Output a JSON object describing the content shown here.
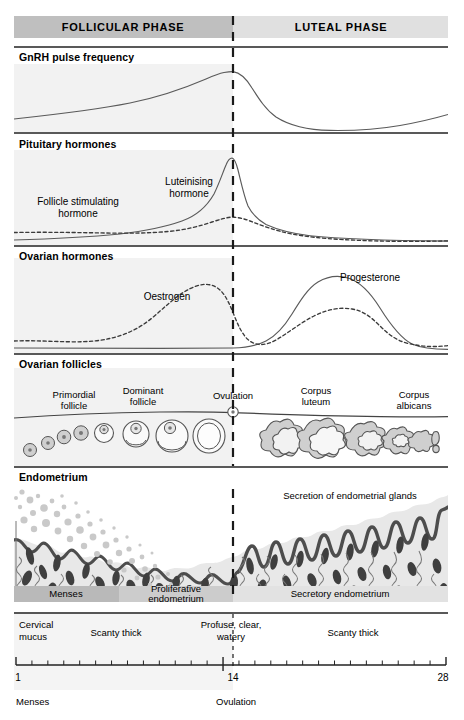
{
  "figure": {
    "width": 464,
    "height": 720
  },
  "colors": {
    "follicular_header_fill": "#bfbfbf",
    "luteal_header_fill": "#e0e0e0",
    "panel_tint": "#f2f2f2",
    "line": "#555555",
    "rule": "#333333",
    "follicle_fill": "#cfcfcf",
    "endometrium_fill": "#e8e8e8",
    "gland_fill": "#4a4a4a",
    "menses_band": "#b9b9b9",
    "proliferative_band": "#cccccc",
    "secretory_band": "#e2e2e2",
    "blood_dot": "#c8c8c8"
  },
  "header": {
    "follicular": "FOLLICULAR PHASE",
    "luteal": "LUTEAL PHASE"
  },
  "sections": [
    {
      "id": "gnrh",
      "label": "GnRH pulse frequency"
    },
    {
      "id": "pituitary",
      "label": "Pituitary hormones"
    },
    {
      "id": "ovarian",
      "label": "Ovarian hormones"
    },
    {
      "id": "follicles",
      "label": "Ovarian follicles"
    },
    {
      "id": "endometrium",
      "label": "Endometrium"
    }
  ],
  "curve_labels": {
    "fsh": "Follicle stimulating\nhormone",
    "fsh_line1": "Follicle stimulating",
    "fsh_line2": "hormone",
    "lh_line1": "Luteinising",
    "lh_line2": "hormone",
    "oestrogen": "Oestrogen",
    "progesterone": "Progesterone"
  },
  "follicle_stage_labels": [
    {
      "line1": "Primordial",
      "line2": "follicle"
    },
    {
      "line1": "Dominant",
      "line2": "follicle"
    },
    {
      "line1": "Ovulation",
      "line2": ""
    },
    {
      "line1": "Corpus",
      "line2": "luteum"
    },
    {
      "line1": "Corpus",
      "line2": "albicans"
    }
  ],
  "endometrium": {
    "secretion_note": "Secretion of endometrial glands",
    "bands": [
      {
        "label": "Menses",
        "label_line1": "Menses",
        "label_line2": ""
      },
      {
        "label": "Proliferative endometrium",
        "label_line1": "Proliferative",
        "label_line2": "endometrium"
      },
      {
        "label": "Secretory endometrium",
        "label_line1": "Secretory endometrium",
        "label_line2": ""
      }
    ]
  },
  "cervical_mucus": {
    "row_title_line1": "Cervical",
    "row_title_line2": "mucus",
    "entries": [
      {
        "text": "Scanty thick"
      },
      {
        "line1": "Profuse, clear,",
        "line2": "watery"
      },
      {
        "text": "Scanty thick"
      }
    ]
  },
  "axis": {
    "start_day": 1,
    "mid_day": 14,
    "end_day": 28,
    "tick_count": 28,
    "labels": {
      "start": "1",
      "mid": "14",
      "end": "28"
    }
  },
  "footer": {
    "menses": "Menses",
    "ovulation": "Ovulation"
  },
  "chart_data": {
    "type": "line",
    "xlabel": "Day of cycle",
    "xlim": [
      1,
      28
    ],
    "grid": false,
    "legend": "inline-annotations",
    "panels": [
      {
        "name": "GnRH pulse frequency",
        "series": [
          {
            "name": "GnRH pulse frequency",
            "style": "solid",
            "x": [
              1,
              4,
              7,
              10,
              12,
              13,
              14,
              15,
              16,
              18,
              21,
              24,
              26,
              28
            ],
            "values": [
              18,
              21,
              25,
              32,
              48,
              62,
              70,
              60,
              38,
              16,
              8,
              7,
              11,
              20
            ]
          }
        ]
      },
      {
        "name": "Pituitary hormones",
        "series": [
          {
            "name": "Luteinising hormone",
            "style": "solid",
            "x": [
              1,
              4,
              7,
              10,
              12,
              13,
              13.8,
              14.4,
              15,
              16,
              18,
              21,
              24,
              28
            ],
            "values": [
              8,
              9,
              11,
              16,
              30,
              62,
              95,
              70,
              45,
              32,
              24,
              17,
              12,
              8
            ]
          },
          {
            "name": "Follicle stimulating hormone",
            "style": "dashed",
            "x": [
              1,
              3,
              6,
              9,
              11,
              12.5,
              13.6,
              14.5,
              16,
              19,
              22,
              25,
              28
            ],
            "values": [
              22,
              20,
              18,
              18,
              22,
              30,
              40,
              36,
              25,
              16,
              11,
              9,
              10
            ]
          }
        ]
      },
      {
        "name": "Ovarian hormones",
        "series": [
          {
            "name": "Oestrogen",
            "style": "dashed",
            "x": [
              1,
              4,
              7,
              9,
              11,
              12,
              13,
              13.6,
              14.4,
              16,
              18,
              20,
              22,
              24,
              26,
              28
            ],
            "values": [
              12,
              11,
              13,
              20,
              35,
              52,
              68,
              76,
              62,
              30,
              34,
              44,
              52,
              55,
              38,
              22
            ]
          },
          {
            "name": "Progesterone",
            "style": "solid",
            "x": [
              1,
              6,
              11,
              13,
              14,
              15,
              17,
              19,
              21,
              22,
              24,
              26,
              27,
              28
            ],
            "values": [
              5,
              5,
              5,
              5,
              6,
              12,
              40,
              72,
              86,
              87,
              72,
              36,
              16,
              11
            ]
          }
        ]
      }
    ],
    "follicle_stages_x": [
      2,
      3.5,
      5,
      6.5,
      8.5,
      10.5,
      12.5,
      14,
      16.5,
      18.5,
      21,
      23,
      25,
      26.8
    ],
    "band_ranges": [
      {
        "label": "Menses",
        "from_day": 1,
        "to_day": 6
      },
      {
        "label": "Proliferative endometrium",
        "from_day": 6,
        "to_day": 14
      },
      {
        "label": "Secretory endometrium",
        "from_day": 14,
        "to_day": 28
      }
    ]
  }
}
